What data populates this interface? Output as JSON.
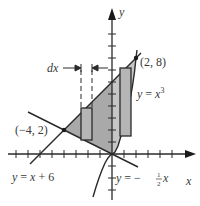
{
  "figure": {
    "type": "area-between-curves",
    "axes": {
      "x_label": "x",
      "y_label": "y",
      "origin_px": [
        112,
        154
      ],
      "unit_px": 12,
      "x_ticks": [
        -8,
        -7,
        -6,
        -5,
        -4,
        -3,
        -2,
        -1,
        1,
        2,
        3,
        4,
        5,
        6
      ],
      "y_ticks": [
        -4,
        -3,
        -2,
        -1,
        1,
        2,
        3,
        4,
        5,
        6,
        7,
        8,
        9,
        10
      ]
    },
    "curves": [
      {
        "name": "line-upper",
        "equation": "y = x + 6",
        "label_parts": [
          "y",
          " = ",
          "x",
          " + 6"
        ]
      },
      {
        "name": "cubic",
        "equation": "y = x^3",
        "label_parts": [
          "y",
          " = ",
          "x",
          "3"
        ]
      },
      {
        "name": "line-lower",
        "equation": "y = -1/2 x",
        "label_parts": [
          "y",
          " = ",
          "−",
          "1",
          "2",
          "x"
        ]
      }
    ],
    "points": [
      {
        "label": "(2, 8)",
        "x": 2,
        "y": 8
      },
      {
        "label": "(−4, 2)",
        "x": -4,
        "y": 2
      }
    ],
    "shaded_region": "between y = x + 6 (top) and y = -x/2 for -4 ≤ x ≤ 0, y = x^3 for 0 ≤ x ≤ 2",
    "strips": [
      {
        "name": "left-strip",
        "x_range": [
          -2.6,
          -1.7
        ]
      },
      {
        "name": "right-strip",
        "x_range": [
          0.67,
          1.58
        ]
      }
    ],
    "dx_label": "dx",
    "colors": {
      "shade": "#a9a9a9",
      "shade_light": "#c8c8c8",
      "stroke": "#2a2a2a",
      "text": "#3a3a3a"
    }
  }
}
